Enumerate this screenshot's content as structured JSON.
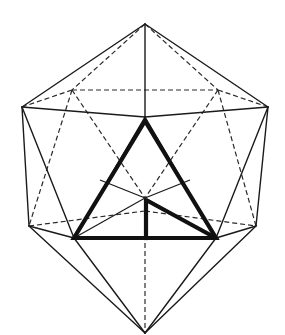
{
  "figure": {
    "colors": {
      "background": "#ffffff",
      "line": "#1a1a1a",
      "emphasis": "#111111"
    },
    "line_styles": {
      "visible_edges": "solid",
      "hidden_edges": "dashed",
      "inscribed_triangle": "bold"
    }
  }
}
